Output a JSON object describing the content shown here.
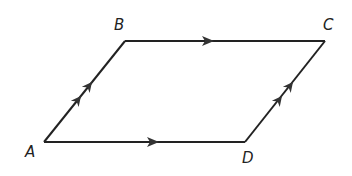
{
  "diagram": {
    "type": "parallelogram",
    "stroke_color": "#222222",
    "vertices": [
      {
        "label": "A",
        "x": 44,
        "y": 142,
        "label_x": 25,
        "label_y": 157
      },
      {
        "label": "B",
        "x": 125,
        "y": 41,
        "label_x": 114,
        "label_y": 30
      },
      {
        "label": "C",
        "x": 325,
        "y": 41,
        "label_x": 323,
        "label_y": 30
      },
      {
        "label": "D",
        "x": 245,
        "y": 142,
        "label_x": 242,
        "label_y": 163
      }
    ],
    "edges": [
      {
        "from": "A",
        "to": "B",
        "arrows": 2
      },
      {
        "from": "B",
        "to": "C",
        "arrows": 1
      },
      {
        "from": "D",
        "to": "C",
        "arrows": 2
      },
      {
        "from": "A",
        "to": "D",
        "arrows": 1
      }
    ]
  }
}
